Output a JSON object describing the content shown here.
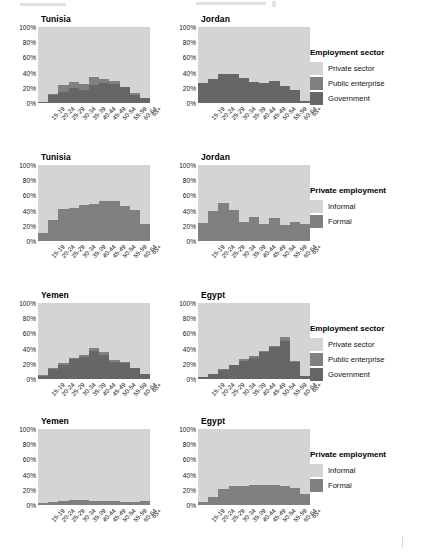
{
  "chart_data": {
    "type": "bar",
    "title": "",
    "subtitle": "",
    "xlabel": "",
    "ylabel": "",
    "ylim": [
      0,
      100
    ],
    "ytick_labels": [
      "0%",
      "20%",
      "40%",
      "60%",
      "80%",
      "100%"
    ],
    "ytick_values": [
      0,
      20,
      40,
      60,
      80,
      100
    ],
    "grid": true,
    "stacked": true,
    "stack_mode": "percent",
    "legend_position": "right",
    "categories": [
      "15-19",
      "20-24",
      "25-29",
      "30-34",
      "35-39",
      "40-44",
      "45-49",
      "50-54",
      "55-59",
      "60-64",
      "65+"
    ],
    "facet_layout": "4 rows x 2 columns",
    "panels": [
      {
        "row": 0,
        "column": 0,
        "title": "Tunisia",
        "legend_group": "employment_sector",
        "series": [
          {
            "name": "Government",
            "color": "#666666",
            "values": [
              1,
              10,
              14,
              20,
              17,
              24,
              26,
              25,
              21,
              11,
              7
            ]
          },
          {
            "name": "Public enterprise",
            "color": "#808080",
            "values": [
              1,
              2,
              10,
              8,
              8,
              10,
              5,
              4,
              0,
              2,
              0
            ]
          },
          {
            "name": "Private sector",
            "color": "#d4d4d4",
            "values": [
              98,
              88,
              76,
              72,
              75,
              66,
              69,
              71,
              79,
              87,
              93
            ]
          }
        ]
      },
      {
        "row": 0,
        "column": 1,
        "title": "Jordan",
        "legend_group": "employment_sector",
        "series": [
          {
            "name": "Government",
            "color": "#666666",
            "values": [
              26,
              31,
              38,
              38,
              33,
              28,
              26,
              29,
              23,
              17,
              3
            ]
          },
          {
            "name": "Public enterprise",
            "color": "#808080",
            "values": [
              0,
              0,
              0,
              0,
              0,
              0,
              0,
              0,
              0,
              0,
              0
            ]
          },
          {
            "name": "Private sector",
            "color": "#d4d4d4",
            "values": [
              74,
              69,
              62,
              62,
              67,
              72,
              74,
              71,
              77,
              83,
              97
            ]
          }
        ]
      },
      {
        "row": 1,
        "column": 0,
        "title": "Tunisia",
        "legend_group": "private_employment",
        "series": [
          {
            "name": "Formal",
            "color": "#808080",
            "values": [
              10,
              27,
              42,
              43,
              47,
              49,
              52,
              53,
              46,
              41,
              23
            ]
          },
          {
            "name": "Informal",
            "color": "#d4d4d4",
            "values": [
              90,
              73,
              58,
              57,
              53,
              51,
              48,
              47,
              54,
              59,
              77
            ]
          }
        ]
      },
      {
        "row": 1,
        "column": 1,
        "title": "Jordan",
        "legend_group": "private_employment",
        "series": [
          {
            "name": "Formal",
            "color": "#808080",
            "values": [
              24,
              40,
              50,
              41,
              25,
              31,
              22,
              30,
              21,
              25,
              23
            ]
          },
          {
            "name": "Informal",
            "color": "#d4d4d4",
            "values": [
              76,
              60,
              50,
              59,
              75,
              69,
              78,
              70,
              79,
              75,
              77
            ]
          }
        ]
      },
      {
        "row": 2,
        "column": 0,
        "title": "Yemen",
        "legend_group": "employment_sector",
        "series": [
          {
            "name": "Government",
            "color": "#666666",
            "values": [
              4,
              13,
              19,
              26,
              29,
              37,
              32,
              23,
              21,
              14,
              7
            ]
          },
          {
            "name": "Public enterprise",
            "color": "#808080",
            "values": [
              1,
              1,
              2,
              2,
              3,
              4,
              3,
              2,
              2,
              1,
              0
            ]
          },
          {
            "name": "Private sector",
            "color": "#d4d4d4",
            "values": [
              95,
              86,
              79,
              72,
              68,
              59,
              65,
              75,
              77,
              85,
              93
            ]
          }
        ]
      },
      {
        "row": 2,
        "column": 1,
        "title": "Egypt",
        "legend_group": "employment_sector",
        "series": [
          {
            "name": "Government",
            "color": "#666666",
            "values": [
              2,
              6,
              12,
              18,
              24,
              28,
              35,
              42,
              50,
              22,
              4
            ]
          },
          {
            "name": "Public enterprise",
            "color": "#808080",
            "values": [
              0,
              1,
              1,
              1,
              2,
              2,
              2,
              2,
              5,
              2,
              0
            ]
          },
          {
            "name": "Private sector",
            "color": "#d4d4d4",
            "values": [
              98,
              93,
              87,
              81,
              74,
              70,
              63,
              56,
              45,
              76,
              96
            ]
          }
        ]
      },
      {
        "row": 3,
        "column": 0,
        "title": "Yemen",
        "legend_group": "private_employment",
        "series": [
          {
            "name": "Formal",
            "color": "#808080",
            "values": [
              3,
              4,
              5,
              6,
              6,
              5,
              5,
              5,
              4,
              4,
              5
            ]
          },
          {
            "name": "Informal",
            "color": "#d4d4d4",
            "values": [
              97,
              96,
              95,
              94,
              94,
              95,
              95,
              95,
              96,
              96,
              95
            ]
          }
        ]
      },
      {
        "row": 3,
        "column": 1,
        "title": "Egypt",
        "legend_group": "private_employment",
        "series": [
          {
            "name": "Formal",
            "color": "#808080",
            "values": [
              4,
              11,
              21,
              25,
              25,
              26,
              26,
              26,
              25,
              22,
              14
            ]
          },
          {
            "name": "Informal",
            "color": "#d4d4d4",
            "values": [
              96,
              89,
              79,
              75,
              75,
              74,
              74,
              74,
              75,
              78,
              86
            ]
          }
        ]
      }
    ],
    "legends": [
      {
        "id": "employment_sector",
        "title": "Employment sector",
        "items": [
          {
            "label": "Private sector",
            "color": "#d4d4d4"
          },
          {
            "label": "Public enterprise",
            "color": "#808080"
          },
          {
            "label": "Government",
            "color": "#666666"
          }
        ]
      },
      {
        "id": "private_employment",
        "title": "Private employment",
        "items": [
          {
            "label": "Informal",
            "color": "#d4d4d4"
          },
          {
            "label": "Formal",
            "color": "#808080"
          }
        ]
      }
    ]
  }
}
